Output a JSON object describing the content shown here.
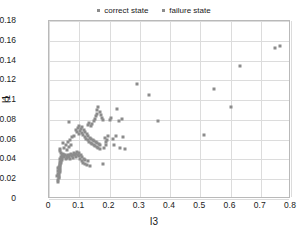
{
  "chart_data": {
    "type": "scatter",
    "title": "",
    "xlabel": "I3",
    "ylabel": "I1",
    "xlim": [
      0,
      0.8
    ],
    "ylim": [
      0,
      0.18
    ],
    "xticks": [
      "0",
      "0.1",
      "0.2",
      "0.3",
      "0.4",
      "0.5",
      "0.6",
      "0.7",
      "0.8"
    ],
    "xtick_values": [
      0,
      0.1,
      0.2,
      0.3,
      0.4,
      0.5,
      0.6,
      0.7,
      0.8
    ],
    "yticks": [
      "0",
      "0.02",
      "0.04",
      "0.06",
      "0.08",
      "0.1",
      "0.12",
      "0.14",
      "0.16",
      "0.18"
    ],
    "ytick_values": [
      0,
      0.02,
      0.04,
      0.06,
      0.08,
      0.1,
      0.12,
      0.14,
      0.16,
      0.18
    ],
    "grid": true,
    "legend_position": "top-center",
    "marker": "square",
    "marker_color": "#8c8c8c",
    "series": [
      {
        "name": "correct state",
        "color": "#8c8c8c",
        "points": [
          [
            0.03,
            0.017
          ],
          [
            0.032,
            0.021
          ],
          [
            0.033,
            0.024
          ],
          [
            0.034,
            0.026
          ],
          [
            0.031,
            0.028
          ],
          [
            0.035,
            0.029
          ],
          [
            0.036,
            0.027
          ],
          [
            0.033,
            0.03
          ],
          [
            0.037,
            0.031
          ],
          [
            0.034,
            0.032
          ],
          [
            0.038,
            0.033
          ],
          [
            0.036,
            0.034
          ],
          [
            0.035,
            0.035
          ],
          [
            0.039,
            0.036
          ],
          [
            0.037,
            0.037
          ],
          [
            0.04,
            0.038
          ],
          [
            0.042,
            0.039
          ],
          [
            0.038,
            0.04
          ],
          [
            0.044,
            0.041
          ],
          [
            0.041,
            0.042
          ],
          [
            0.046,
            0.043
          ],
          [
            0.043,
            0.044
          ],
          [
            0.048,
            0.045
          ],
          [
            0.045,
            0.046
          ],
          [
            0.05,
            0.042
          ],
          [
            0.052,
            0.044
          ],
          [
            0.055,
            0.04
          ],
          [
            0.058,
            0.041
          ],
          [
            0.06,
            0.043
          ],
          [
            0.062,
            0.045
          ],
          [
            0.065,
            0.042
          ],
          [
            0.068,
            0.044
          ],
          [
            0.07,
            0.04
          ],
          [
            0.072,
            0.046
          ],
          [
            0.075,
            0.043
          ],
          [
            0.078,
            0.045
          ],
          [
            0.08,
            0.041
          ],
          [
            0.082,
            0.047
          ],
          [
            0.085,
            0.044
          ],
          [
            0.088,
            0.046
          ],
          [
            0.09,
            0.042
          ],
          [
            0.092,
            0.048
          ],
          [
            0.095,
            0.045
          ],
          [
            0.098,
            0.043
          ],
          [
            0.1,
            0.047
          ],
          [
            0.102,
            0.04
          ],
          [
            0.105,
            0.044
          ],
          [
            0.108,
            0.038
          ],
          [
            0.11,
            0.042
          ],
          [
            0.112,
            0.036
          ],
          [
            0.115,
            0.04
          ],
          [
            0.118,
            0.035
          ],
          [
            0.12,
            0.039
          ],
          [
            0.125,
            0.034
          ],
          [
            0.13,
            0.038
          ],
          [
            0.135,
            0.033
          ],
          [
            0.045,
            0.057
          ],
          [
            0.05,
            0.052
          ],
          [
            0.055,
            0.055
          ],
          [
            0.06,
            0.05
          ],
          [
            0.063,
            0.058
          ],
          [
            0.066,
            0.053
          ],
          [
            0.069,
            0.06
          ],
          [
            0.072,
            0.055
          ],
          [
            0.035,
            0.049
          ],
          [
            0.038,
            0.051
          ],
          [
            0.041,
            0.047
          ],
          [
            0.028,
            0.023
          ],
          [
            0.029,
            0.019
          ],
          [
            0.031,
            0.025
          ],
          [
            0.033,
            0.022
          ],
          [
            0.03,
            0.031
          ]
        ]
      },
      {
        "name": "failure state",
        "color": "#8c8c8c",
        "points": [
          [
            0.065,
            0.078
          ],
          [
            0.075,
            0.063
          ],
          [
            0.082,
            0.064
          ],
          [
            0.088,
            0.07
          ],
          [
            0.092,
            0.068
          ],
          [
            0.095,
            0.072
          ],
          [
            0.098,
            0.066
          ],
          [
            0.1,
            0.074
          ],
          [
            0.103,
            0.069
          ],
          [
            0.105,
            0.071
          ],
          [
            0.108,
            0.067
          ],
          [
            0.11,
            0.073
          ],
          [
            0.113,
            0.065
          ],
          [
            0.115,
            0.07
          ],
          [
            0.118,
            0.063
          ],
          [
            0.12,
            0.068
          ],
          [
            0.123,
            0.061
          ],
          [
            0.125,
            0.066
          ],
          [
            0.128,
            0.06
          ],
          [
            0.13,
            0.064
          ],
          [
            0.133,
            0.058
          ],
          [
            0.135,
            0.062
          ],
          [
            0.138,
            0.057
          ],
          [
            0.14,
            0.061
          ],
          [
            0.143,
            0.056
          ],
          [
            0.145,
            0.06
          ],
          [
            0.148,
            0.055
          ],
          [
            0.15,
            0.059
          ],
          [
            0.153,
            0.054
          ],
          [
            0.155,
            0.058
          ],
          [
            0.158,
            0.053
          ],
          [
            0.16,
            0.057
          ],
          [
            0.163,
            0.052
          ],
          [
            0.165,
            0.056
          ],
          [
            0.168,
            0.051
          ],
          [
            0.17,
            0.055
          ],
          [
            0.128,
            0.075
          ],
          [
            0.133,
            0.077
          ],
          [
            0.138,
            0.074
          ],
          [
            0.143,
            0.076
          ],
          [
            0.148,
            0.079
          ],
          [
            0.152,
            0.081
          ],
          [
            0.155,
            0.084
          ],
          [
            0.158,
            0.086
          ],
          [
            0.16,
            0.09
          ],
          [
            0.163,
            0.093
          ],
          [
            0.168,
            0.088
          ],
          [
            0.172,
            0.085
          ],
          [
            0.175,
            0.082
          ],
          [
            0.178,
            0.08
          ],
          [
            0.18,
            0.035
          ],
          [
            0.182,
            0.052
          ],
          [
            0.185,
            0.062
          ],
          [
            0.188,
            0.058
          ],
          [
            0.19,
            0.055
          ],
          [
            0.193,
            0.06
          ],
          [
            0.196,
            0.064
          ],
          [
            0.2,
            0.08
          ],
          [
            0.205,
            0.082
          ],
          [
            0.21,
            0.061
          ],
          [
            0.215,
            0.055
          ],
          [
            0.22,
            0.064
          ],
          [
            0.225,
            0.091
          ],
          [
            0.23,
            0.079
          ],
          [
            0.235,
            0.052
          ],
          [
            0.24,
            0.081
          ],
          [
            0.245,
            0.063
          ],
          [
            0.25,
            0.051
          ],
          [
            0.29,
            0.116
          ],
          [
            0.33,
            0.105
          ],
          [
            0.36,
            0.079
          ],
          [
            0.512,
            0.065
          ],
          [
            0.545,
            0.111
          ],
          [
            0.6,
            0.093
          ],
          [
            0.63,
            0.135
          ],
          [
            0.748,
            0.153
          ],
          [
            0.762,
            0.155
          ]
        ]
      }
    ]
  },
  "legend": {
    "items": [
      {
        "label": "correct state"
      },
      {
        "label": "failure state"
      }
    ]
  }
}
